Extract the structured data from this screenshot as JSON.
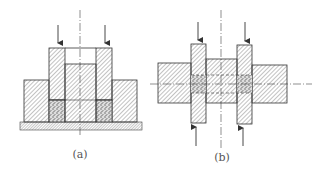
{
  "figure": {
    "colors": {
      "line": "#333333",
      "hatch": "#555555",
      "powder": "#777777",
      "background": "#ffffff"
    },
    "panels": [
      {
        "id": "a",
        "label": "(a)",
        "label_pos": [
          80,
          160
        ],
        "components": [
          "upper-punch-left",
          "upper-punch-right",
          "core-rod",
          "die",
          "powder-fill",
          "base-plate"
        ],
        "arrows": [
          {
            "x": 58,
            "dir": "down"
          },
          {
            "x": 105,
            "dir": "down"
          }
        ]
      },
      {
        "id": "b",
        "label": "(b)",
        "label_pos": [
          222,
          162
        ],
        "components": [
          "upper-punch-left",
          "upper-punch-right",
          "lower-punch-left",
          "lower-punch-right",
          "core-rod",
          "die",
          "powder-fill"
        ],
        "arrows": [
          {
            "x": 198,
            "dir": "down"
          },
          {
            "x": 245,
            "dir": "down"
          },
          {
            "x": 196,
            "dir": "up"
          },
          {
            "x": 243,
            "dir": "up"
          }
        ]
      }
    ]
  }
}
